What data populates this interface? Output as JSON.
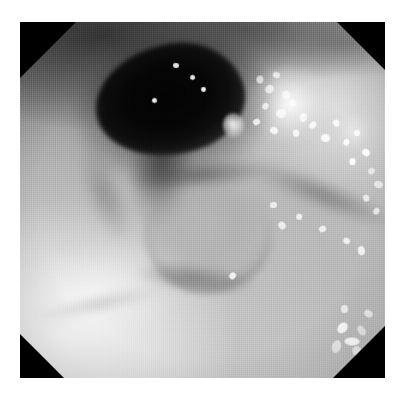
{
  "page": {
    "background_color": "#ffffff",
    "width": 405,
    "height": 393,
    "caption": ""
  },
  "photo": {
    "kind": "endoscopic-photograph",
    "modality": "white-light endoscopy",
    "color_mode": "grayscale",
    "mask_shape": "octagonal",
    "frame": {
      "left": 20,
      "top": 22,
      "width": 365,
      "height": 356
    },
    "border_color": "#000000",
    "alt_text": "Grayscale endoscopic view of mucosa with a dark lumen opening at upper left, a nodular mass centrally, a bright exudate patch on the right, and scattered specular bubble highlights.",
    "tone_range": {
      "black": "#020202",
      "midtone": "#9a9a9a",
      "white": "#ffffff"
    }
  },
  "features": [
    {
      "id": "lumen",
      "name": "dark-lumen-opening",
      "description": "Large black cavity opening at upper-left of the field",
      "approx_center_pct": {
        "x": 41,
        "y": 22
      },
      "tone": "#020202"
    },
    {
      "id": "lumen-tail",
      "name": "lumen-shadow-tail",
      "description": "Shadowed groove descending from the lumen toward the center",
      "approx_center_pct": {
        "x": 38,
        "y": 44
      },
      "tone": "#3a3a3a"
    },
    {
      "id": "nodular-mass",
      "name": "nodular-mucosal-mass",
      "description": "Rounded nodular elevation in the center of the field",
      "approx_center_pct": {
        "x": 51,
        "y": 60
      },
      "tone": "#b0b0b0"
    },
    {
      "id": "bright-patch",
      "name": "bright-exudate-patch",
      "description": "Bright white mottled mucus / exudate patch on the right",
      "approx_center_pct": {
        "x": 75,
        "y": 24
      },
      "tone": "#f4f4f4"
    },
    {
      "id": "bright-fold-bl",
      "name": "bright-mucosal-fold",
      "description": "Brightly illuminated mucosal fold across the lower-left",
      "approx_center_pct": {
        "x": 20,
        "y": 77
      },
      "tone": "#f2f2f2"
    },
    {
      "id": "fold-top",
      "name": "dark-mucosal-folds",
      "description": "Darker mucosal folds along the upper border",
      "approx_center_pct": {
        "x": 45,
        "y": 5
      },
      "tone": "#4a4a4a"
    },
    {
      "id": "groove-c",
      "name": "diagonal-mucosal-groove",
      "description": "Diagonal dark groove running to the lower right",
      "approx_center_pct": {
        "x": 80,
        "y": 49
      },
      "tone": "#6a6a6a"
    }
  ],
  "specks": [
    {
      "x": 64.6,
      "y": 15.2,
      "w": 2.2,
      "h": 2.0
    },
    {
      "x": 67.0,
      "y": 17.6,
      "w": 2.6,
      "h": 2.2
    },
    {
      "x": 69.4,
      "y": 14.0,
      "w": 1.8,
      "h": 1.6
    },
    {
      "x": 71.8,
      "y": 19.4,
      "w": 2.4,
      "h": 2.2
    },
    {
      "x": 66.2,
      "y": 22.8,
      "w": 2.0,
      "h": 1.8
    },
    {
      "x": 70.0,
      "y": 24.4,
      "w": 2.8,
      "h": 2.4
    },
    {
      "x": 73.6,
      "y": 22.0,
      "w": 2.0,
      "h": 1.8
    },
    {
      "x": 76.4,
      "y": 25.8,
      "w": 2.4,
      "h": 2.0
    },
    {
      "x": 63.8,
      "y": 27.2,
      "w": 1.8,
      "h": 1.6
    },
    {
      "x": 68.6,
      "y": 29.6,
      "w": 2.2,
      "h": 2.0
    },
    {
      "x": 74.8,
      "y": 30.4,
      "w": 1.8,
      "h": 1.6
    },
    {
      "x": 79.2,
      "y": 28.2,
      "w": 2.2,
      "h": 1.8
    },
    {
      "x": 82.6,
      "y": 31.6,
      "w": 2.6,
      "h": 2.2
    },
    {
      "x": 85.8,
      "y": 27.4,
      "w": 1.8,
      "h": 1.6
    },
    {
      "x": 88.4,
      "y": 33.0,
      "w": 2.0,
      "h": 1.8
    },
    {
      "x": 91.6,
      "y": 30.2,
      "w": 1.6,
      "h": 1.6
    },
    {
      "x": 93.8,
      "y": 35.6,
      "w": 2.2,
      "h": 2.0
    },
    {
      "x": 90.2,
      "y": 38.4,
      "w": 1.8,
      "h": 1.6
    },
    {
      "x": 95.4,
      "y": 41.0,
      "w": 2.0,
      "h": 1.8
    },
    {
      "x": 97.0,
      "y": 44.8,
      "w": 2.4,
      "h": 2.0
    },
    {
      "x": 94.0,
      "y": 48.6,
      "w": 1.8,
      "h": 1.6
    },
    {
      "x": 96.6,
      "y": 52.2,
      "w": 2.0,
      "h": 1.8
    },
    {
      "x": 68.4,
      "y": 50.6,
      "w": 1.8,
      "h": 1.6
    },
    {
      "x": 70.8,
      "y": 56.2,
      "w": 2.2,
      "h": 2.0
    },
    {
      "x": 75.6,
      "y": 53.8,
      "w": 1.6,
      "h": 1.6
    },
    {
      "x": 82.0,
      "y": 57.4,
      "w": 1.8,
      "h": 1.6
    },
    {
      "x": 88.6,
      "y": 60.8,
      "w": 2.0,
      "h": 1.8
    },
    {
      "x": 92.4,
      "y": 63.2,
      "w": 2.4,
      "h": 2.0
    },
    {
      "x": 57.2,
      "y": 70.6,
      "w": 1.8,
      "h": 1.6
    },
    {
      "x": 42.0,
      "y": 11.4,
      "w": 1.6,
      "h": 1.4
    },
    {
      "x": 46.6,
      "y": 15.0,
      "w": 1.4,
      "h": 1.4
    },
    {
      "x": 36.2,
      "y": 21.4,
      "w": 1.4,
      "h": 1.4
    },
    {
      "x": 49.6,
      "y": 18.2,
      "w": 1.4,
      "h": 1.4
    },
    {
      "x": 87.2,
      "y": 84.4,
      "w": 2.6,
      "h": 3.4
    },
    {
      "x": 89.8,
      "y": 87.6,
      "w": 2.2,
      "h": 4.2
    },
    {
      "x": 92.6,
      "y": 85.0,
      "w": 2.0,
      "h": 3.0
    },
    {
      "x": 85.6,
      "y": 89.2,
      "w": 2.4,
      "h": 3.6
    },
    {
      "x": 91.0,
      "y": 91.4,
      "w": 2.8,
      "h": 2.4
    },
    {
      "x": 94.4,
      "y": 80.6,
      "w": 2.0,
      "h": 2.6
    },
    {
      "x": 88.0,
      "y": 79.4,
      "w": 1.8,
      "h": 2.2
    }
  ]
}
